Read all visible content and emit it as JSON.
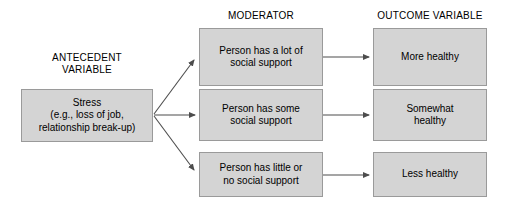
{
  "diagram": {
    "background_color": "#ffffff",
    "box_fill_color": "#d4d4d4",
    "box_border_color": "#9a9a9a",
    "arrow_color": "#4d4d4d",
    "text_color": "#000000"
  },
  "headers": {
    "antecedent": "ANTECEDENT\nVARIABLE",
    "moderator": "MODERATOR",
    "outcome": "OUTCOME VARIABLE"
  },
  "antecedent": {
    "label": "Stress\n(e.g., loss of job,\nrelationship break-up)"
  },
  "moderators": [
    {
      "label": "Person has a lot of\nsocial support"
    },
    {
      "label": "Person has some\nsocial support"
    },
    {
      "label": "Person has little or\nno social support"
    }
  ],
  "outcomes": [
    {
      "label": "More healthy"
    },
    {
      "label": "Somewhat\nhealthy"
    },
    {
      "label": "Less healthy"
    }
  ]
}
